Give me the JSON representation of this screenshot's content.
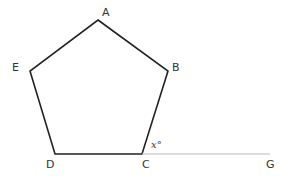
{
  "diagram": {
    "type": "geometry",
    "vertices": [
      {
        "name": "A",
        "x": 98,
        "y": 20
      },
      {
        "name": "B",
        "x": 168,
        "y": 71
      },
      {
        "name": "C",
        "x": 142,
        "y": 154
      },
      {
        "name": "D",
        "x": 55,
        "y": 154
      },
      {
        "name": "E",
        "x": 30,
        "y": 71
      }
    ],
    "extension_point": {
      "name": "G",
      "x": 270,
      "y": 154
    },
    "labels": {
      "A": "A",
      "B": "B",
      "C": "C",
      "D": "D",
      "E": "E",
      "G": "G",
      "angle": "x°"
    },
    "colors": {
      "pentagon_stroke": "#222222",
      "extension_stroke": "#bbbbbb",
      "text": "#333333"
    }
  }
}
